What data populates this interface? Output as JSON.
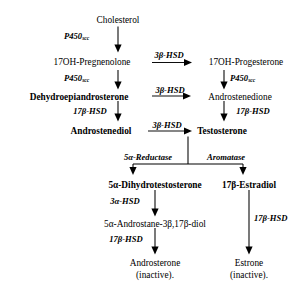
{
  "diagram": {
    "type": "flowchart",
    "background": "#ffffff",
    "line_color": "#000000"
  },
  "nodes": {
    "cholesterol": "Cholesterol",
    "oh_pregnenolone": "17OH-Pregnenolone",
    "oh_progesterone": "17OH-Progesterone",
    "dhea": "Dehydroepiandrosterone",
    "androstenedione": "Androstenedione",
    "androstenediol": "Androstenediol",
    "testosterone": "Testosterone",
    "dht": "5α-Dihydrotestosterone",
    "estradiol": "17β-Estradiol",
    "androstanediol": "5α-Androstane-3β,17β-diol",
    "androsterone": "Androsterone",
    "androsterone_state": "(inactive).",
    "estrone": "Estrone",
    "estrone_state": "(inactive)."
  },
  "enzymes": {
    "p450scc_main": "P450",
    "p450scc_sub": "scc",
    "hsd3b": "3β-HSD",
    "hsd17b": "17β-HSD",
    "hsd3a": "3α-HSD",
    "reductase5a": "5α-Reductase",
    "aromatase": "Aromatase"
  }
}
